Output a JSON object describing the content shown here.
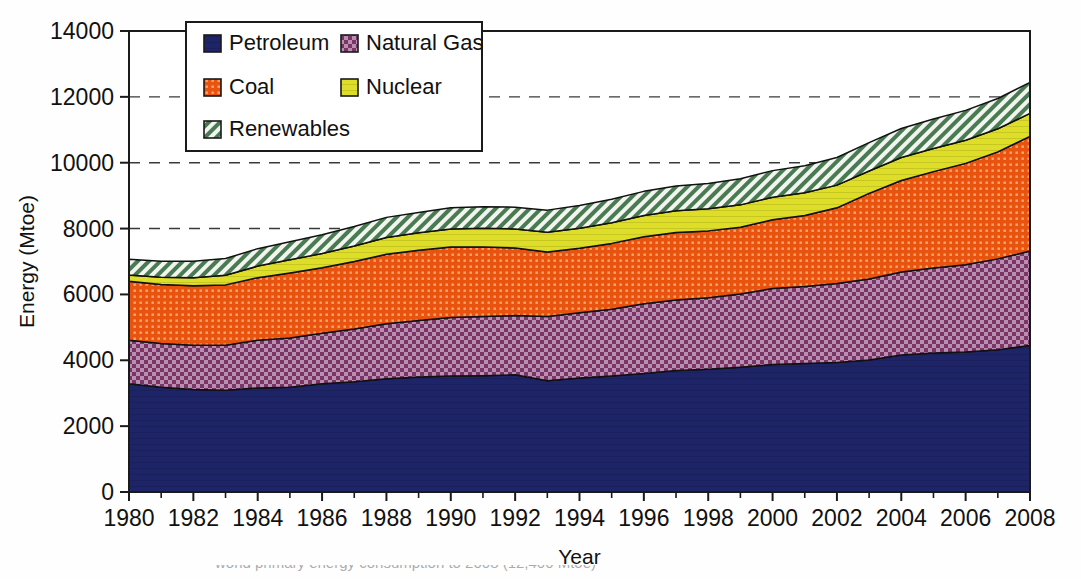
{
  "chart_data": {
    "type": "area",
    "title": "",
    "xlabel": "Year",
    "ylabel": "Energy (Mtoe)",
    "stacked": true,
    "grid": true,
    "gridlines_dashed_at": [
      8000,
      10000,
      12000
    ],
    "legend_position": "top-left-inside",
    "xlim": [
      1980,
      2008
    ],
    "ylim": [
      0,
      14000
    ],
    "ytick_labels": [
      "0",
      "2000",
      "4000",
      "6000",
      "8000",
      "10000",
      "12000",
      "14000"
    ],
    "yticks": [
      0,
      2000,
      4000,
      6000,
      8000,
      10000,
      12000,
      14000
    ],
    "xtick_labels": [
      "1980",
      "1982",
      "1984",
      "1986",
      "1988",
      "1990",
      "1992",
      "1994",
      "1996",
      "1998",
      "2000",
      "2002",
      "2004",
      "2006",
      "2008"
    ],
    "xticks": [
      1980,
      1982,
      1984,
      1986,
      1988,
      1990,
      1992,
      1994,
      1996,
      1998,
      2000,
      2002,
      2004,
      2006,
      2008
    ],
    "x": [
      1980,
      1981,
      1982,
      1983,
      1984,
      1985,
      1986,
      1987,
      1988,
      1989,
      1990,
      1991,
      1992,
      1993,
      1994,
      1995,
      1996,
      1997,
      1998,
      1999,
      2000,
      2001,
      2002,
      2003,
      2004,
      2005,
      2006,
      2007,
      2008
    ],
    "series": [
      {
        "name": "Petroleum",
        "color": "#1e2468",
        "pattern": "solid",
        "values": [
          3290,
          3180,
          3110,
          3090,
          3160,
          3180,
          3290,
          3350,
          3440,
          3490,
          3520,
          3530,
          3560,
          3380,
          3460,
          3520,
          3600,
          3690,
          3730,
          3790,
          3870,
          3900,
          3930,
          4010,
          4160,
          4220,
          4250,
          4320,
          4450
        ]
      },
      {
        "name": "Natural Gas",
        "color": "#7a3468",
        "pattern": "checker",
        "values": [
          1320,
          1330,
          1350,
          1370,
          1450,
          1500,
          1530,
          1600,
          1670,
          1720,
          1780,
          1800,
          1800,
          1950,
          1980,
          2030,
          2120,
          2140,
          2170,
          2220,
          2310,
          2340,
          2400,
          2460,
          2520,
          2580,
          2650,
          2760,
          2870
        ]
      },
      {
        "name": "Coal",
        "color": "#e8540f",
        "pattern": "dots",
        "values": [
          1790,
          1790,
          1800,
          1830,
          1900,
          1970,
          1990,
          2050,
          2110,
          2130,
          2140,
          2110,
          2050,
          1960,
          1960,
          2000,
          2030,
          2050,
          2030,
          2030,
          2090,
          2160,
          2300,
          2600,
          2780,
          2930,
          3080,
          3250,
          3480
        ]
      },
      {
        "name": "Nuclear",
        "color": "#dede28",
        "pattern": "solid",
        "values": [
          190,
          220,
          250,
          290,
          350,
          400,
          430,
          470,
          510,
          530,
          550,
          570,
          580,
          600,
          610,
          630,
          650,
          660,
          670,
          680,
          680,
          690,
          690,
          680,
          700,
          700,
          700,
          700,
          700
        ]
      },
      {
        "name": "Renewables",
        "color": "#4a7a52",
        "pattern": "hatch",
        "values": [
          480,
          490,
          500,
          510,
          530,
          550,
          570,
          590,
          610,
          620,
          640,
          650,
          660,
          670,
          690,
          710,
          730,
          750,
          770,
          790,
          810,
          820,
          840,
          860,
          880,
          900,
          910,
          920,
          940
        ]
      }
    ],
    "legend_items": [
      {
        "label": "Petroleum",
        "color": "#1e2468",
        "pattern": "solid"
      },
      {
        "label": "Natural Gas",
        "color": "#7a3468",
        "pattern": "checker"
      },
      {
        "label": "Coal",
        "color": "#e8540f",
        "pattern": "dots"
      },
      {
        "label": "Nuclear",
        "color": "#dede28",
        "pattern": "solid"
      },
      {
        "label": "Renewables",
        "color": "#4a7a52",
        "pattern": "hatch"
      }
    ]
  },
  "caption": {
    "partial_text": "world primary energy consumption to 2008  (12,400 Mtoe)"
  }
}
